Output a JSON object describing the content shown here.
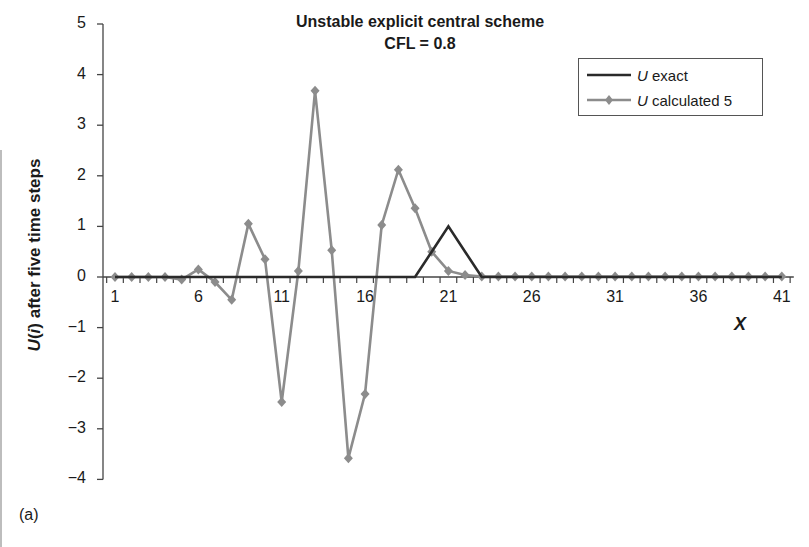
{
  "chart_data": {
    "type": "line",
    "title": "Unstable explicit central scheme",
    "subtitle": "CFL = 0.8",
    "xlabel": "X",
    "ylabel": "U(i) after five time steps",
    "panel_label": "(a)",
    "ylim": [
      -4,
      5
    ],
    "yticks": [
      5,
      4,
      3,
      2,
      1,
      0,
      -1,
      -2,
      -3,
      -4
    ],
    "xticks": [
      1,
      6,
      11,
      16,
      21,
      26,
      31,
      36,
      41
    ],
    "grid": false,
    "legend_position": "top-right",
    "x": [
      1,
      2,
      3,
      4,
      5,
      6,
      7,
      8,
      9,
      10,
      11,
      12,
      13,
      14,
      15,
      16,
      17,
      18,
      19,
      20,
      21,
      22,
      23,
      24,
      25,
      26,
      27,
      28,
      29,
      30,
      31,
      32,
      33,
      34,
      35,
      36,
      37,
      38,
      39,
      40,
      41
    ],
    "series": [
      {
        "name": "U exact",
        "color": "#2a2a2a",
        "marker": "none",
        "values": [
          0,
          0,
          0,
          0,
          0,
          0,
          0,
          0,
          0,
          0,
          0,
          0,
          0,
          0,
          0,
          0,
          0,
          0,
          0,
          0.5,
          1,
          0.5,
          0,
          0,
          0,
          0,
          0,
          0,
          0,
          0,
          0,
          0,
          0,
          0,
          0,
          0,
          0,
          0,
          0,
          0,
          0
        ]
      },
      {
        "name": "U calculated 5",
        "color": "#8c8c8c",
        "marker": "diamond",
        "values": [
          0,
          0,
          0,
          0,
          -0.05,
          0.15,
          -0.1,
          -0.45,
          1.05,
          0.35,
          -2.47,
          0.12,
          3.68,
          0.53,
          -3.58,
          -2.31,
          1.03,
          2.12,
          1.36,
          0.5,
          0.12,
          0.04,
          0.01,
          0.01,
          0.01,
          0.01,
          0.01,
          0.01,
          0.01,
          0.01,
          0.01,
          0.01,
          0.01,
          0.01,
          0.01,
          0.01,
          0.01,
          0.01,
          0.01,
          0.01,
          0.01
        ]
      }
    ]
  },
  "legend": {
    "exact_italic": "U",
    "exact_rest": " exact",
    "calc_italic": "U",
    "calc_rest": " calculated 5"
  },
  "labels": {
    "ylabel_italic_u": "U",
    "ylabel_open": "(",
    "ylabel_italic_i": "i",
    "ylabel_rest": ") after five time steps"
  }
}
